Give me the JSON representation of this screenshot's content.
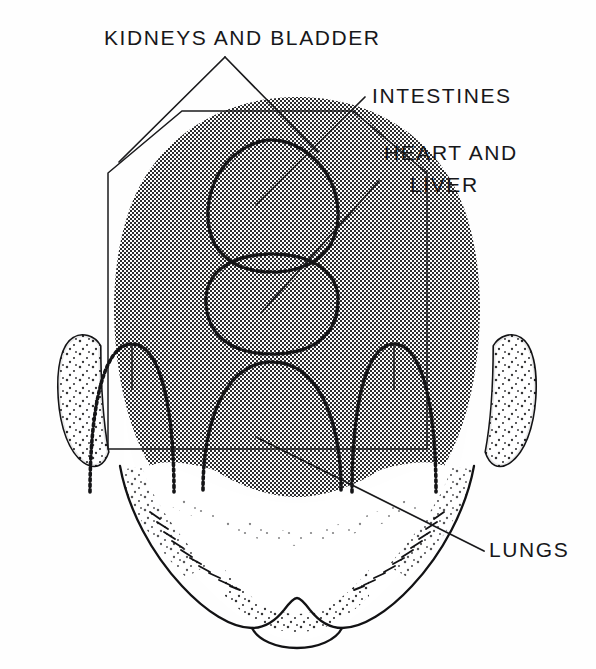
{
  "figure": {
    "view": "superior view of human head",
    "background_color": "#fefefe",
    "ink_color": "#141416",
    "shade_color": "#8c8c8c",
    "canvas": {
      "width": 596,
      "height": 669
    }
  },
  "labels": [
    {
      "id": "kidneys-bladder",
      "text": "KIDNEYS AND BLADDER",
      "x": 104,
      "y": 45,
      "anchor": "start",
      "zone": "hexagon",
      "leader_count": 2
    },
    {
      "id": "intestines",
      "text": "INTESTINES",
      "x": 372,
      "y": 103,
      "anchor": "start",
      "zone": "upper-circle",
      "leader_count": 1
    },
    {
      "id": "heart-liver-line1",
      "text": "HEART AND",
      "x": 384,
      "y": 160,
      "anchor": "start",
      "zone": "lower-circle",
      "leader_count": 1
    },
    {
      "id": "heart-liver-line2",
      "text": "LIVER",
      "x": 410,
      "y": 192,
      "anchor": "start",
      "zone": "lower-circle",
      "leader_count": 0
    },
    {
      "id": "lungs",
      "text": "LUNGS",
      "x": 489,
      "y": 557,
      "anchor": "start",
      "zone": "lower-arch",
      "leader_count": 1
    }
  ],
  "zones": [
    {
      "id": "hexagon",
      "name": "kidneys-and-bladder-zone",
      "shape": "hexagon",
      "stroke": "solid"
    },
    {
      "id": "upper-circle",
      "name": "intestines-zone",
      "shape": "rounded-square",
      "stroke": "dotted"
    },
    {
      "id": "lower-circle",
      "name": "heart-and-liver-zone",
      "shape": "rounded-square",
      "stroke": "dotted"
    },
    {
      "id": "center-arch",
      "name": "lungs-center-zone",
      "shape": "arch",
      "stroke": "dotted"
    },
    {
      "id": "left-arch",
      "name": "lungs-left-zone",
      "shape": "arch",
      "stroke": "dotted"
    },
    {
      "id": "right-arch",
      "name": "lungs-right-zone",
      "shape": "arch",
      "stroke": "dotted"
    }
  ],
  "anatomy": [
    {
      "id": "scalp",
      "name": "shaded-scalp-region"
    },
    {
      "id": "face",
      "name": "white-face-region"
    },
    {
      "id": "ear-left",
      "name": "left-ear"
    },
    {
      "id": "ear-right",
      "name": "right-ear"
    },
    {
      "id": "chin",
      "name": "chin-and-jaw-outline"
    }
  ]
}
